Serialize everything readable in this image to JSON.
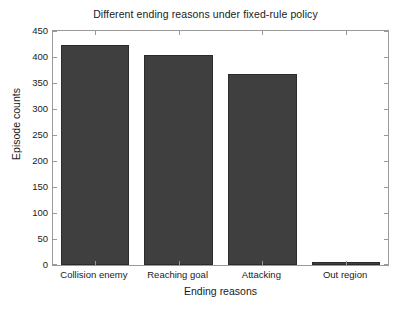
{
  "chart_data": {
    "type": "bar",
    "title": "Different ending reasons under fixed-rule policy",
    "xlabel": "Ending reasons",
    "ylabel": "Episode counts",
    "categories": [
      "Collision enemy",
      "Reaching goal",
      "Attacking",
      "Out region"
    ],
    "values": [
      423,
      404,
      368,
      6
    ],
    "ylim": [
      0,
      450
    ],
    "yticks": [
      0,
      50,
      100,
      150,
      200,
      250,
      300,
      350,
      400,
      450
    ],
    "ytick_labels": [
      "0",
      "50",
      "100",
      "150",
      "200",
      "250",
      "300",
      "350",
      "400",
      "450"
    ],
    "grid": false,
    "legend": null,
    "bar_color": "#3f3f3f",
    "bar_edge_color": "#2b2b2b",
    "axes_color": "#9a9a9a",
    "background_color": "#ffffff",
    "text_color": "#1a1a1a",
    "bar_width_fraction": 0.82
  }
}
